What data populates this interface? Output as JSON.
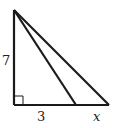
{
  "diagram": {
    "type": "right-triangle",
    "labels": {
      "height": "7",
      "base_segment": "3",
      "extension_segment": "x"
    },
    "right_angle_marker": true,
    "stroke_color": "#1a1a1a"
  }
}
